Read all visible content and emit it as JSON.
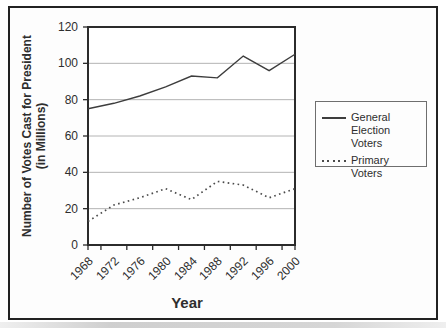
{
  "chart_data": {
    "type": "line",
    "title": "",
    "xlabel": "Year",
    "ylabel": "Number of Votes Cast for President (in Millions)",
    "ylabel_line1": "Number of Votes Cast for President",
    "ylabel_line2": "(in Millions)",
    "categories": [
      "1968",
      "1972",
      "1976",
      "1980",
      "1984",
      "1988",
      "1992",
      "1996",
      "2000"
    ],
    "series": [
      {
        "name": "General Election Voters",
        "line_style": "solid",
        "values": [
          75,
          78,
          82,
          87,
          93,
          92,
          104,
          96,
          105
        ]
      },
      {
        "name": "Primary Voters",
        "line_style": "dotted",
        "values": [
          13,
          22,
          26,
          31,
          25,
          35,
          33,
          26,
          31
        ]
      }
    ],
    "ylim": [
      0,
      120
    ],
    "yticks": [
      0,
      20,
      40,
      60,
      80,
      100,
      120
    ],
    "grid": true,
    "legend_position": "right-outside"
  },
  "colors": {
    "text": "#2e2e2e",
    "line_general": "#3d3d3d",
    "line_primary": "#4a4a4a",
    "grid": "#b4b4b4",
    "plot_border": "#2b2b2b",
    "frame_border": "#222222",
    "legend_border": "#6e6e6e",
    "figure_bg": "#fdfdfd",
    "plot_bg": "#ffffff"
  }
}
